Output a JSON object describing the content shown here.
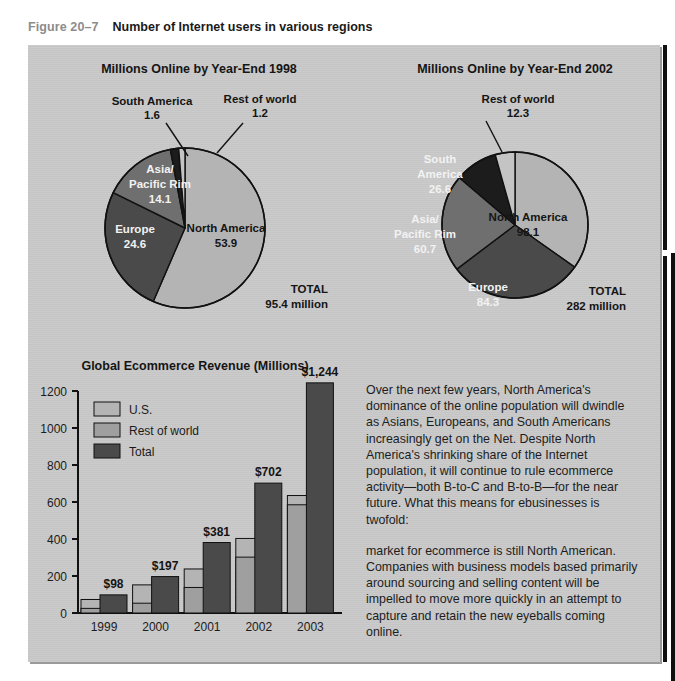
{
  "caption": {
    "figure_number": "Figure 20–7",
    "title": "Number of Internet users in various regions"
  },
  "colors": {
    "panel_bg": "#c9c9c9",
    "slice_light": "#b4b4b4",
    "slice_mid": "#9a9a9a",
    "slice_dark": "#4a4a4a",
    "slice_black": "#1c1c1c",
    "bar_us": "#b4b4b4",
    "bar_row": "#9f9f9f",
    "bar_total": "#4a4a4a",
    "outline": "#111111"
  },
  "chart_data": [
    {
      "type": "pie",
      "id": "pie-1998",
      "title": "Millions Online by Year-End 1998",
      "unit": "millions",
      "total_label": "TOTAL",
      "total_value": "95.4 million",
      "slices": [
        {
          "label": "North America",
          "value": 53.9,
          "value_label": "53.9",
          "color": "#b4b4b4",
          "label_placement": "inside",
          "label_color": "dark"
        },
        {
          "label": "Europe",
          "value": 24.6,
          "value_label": "24.6",
          "color": "#4a4a4a",
          "label_placement": "inside",
          "label_color": "light"
        },
        {
          "label": "Asia/\nPacific Rim",
          "value": 14.1,
          "value_label": "14.1",
          "color": "#6f6f6f",
          "label_placement": "inside",
          "label_color": "light"
        },
        {
          "label": "South America",
          "value": 1.6,
          "value_label": "1.6",
          "color": "#1c1c1c",
          "label_placement": "callout",
          "label_color": "dark"
        },
        {
          "label": "Rest of world",
          "value": 1.2,
          "value_label": "1.2",
          "color": "#c4c4c4",
          "label_placement": "callout",
          "label_color": "dark"
        }
      ]
    },
    {
      "type": "pie",
      "id": "pie-2002",
      "title": "Millions Online by Year-End 2002",
      "unit": "millions",
      "total_label": "TOTAL",
      "total_value": "282 million",
      "slices": [
        {
          "label": "North America",
          "value": 98.1,
          "value_label": "98.1",
          "color": "#b4b4b4",
          "label_placement": "inside",
          "label_color": "dark"
        },
        {
          "label": "Europe",
          "value": 84.3,
          "value_label": "84.3",
          "color": "#4a4a4a",
          "label_placement": "inside",
          "label_color": "light"
        },
        {
          "label": "Asia/\nPacific Rim",
          "value": 60.7,
          "value_label": "60.7",
          "color": "#6f6f6f",
          "label_placement": "inside",
          "label_color": "light"
        },
        {
          "label": "South America",
          "value": 26.6,
          "value_label": "26.6",
          "color": "#1c1c1c",
          "label_placement": "inside",
          "label_color": "light"
        },
        {
          "label": "Rest of world",
          "value": 12.3,
          "value_label": "12.3",
          "color": "#c4c4c4",
          "label_placement": "callout",
          "label_color": "dark"
        }
      ]
    },
    {
      "type": "bar",
      "id": "bar-ecommerce",
      "title": "Global Ecommerce Revenue (Millions)",
      "xlabel": "",
      "ylabel": "",
      "ylim": [
        0,
        1200
      ],
      "yticks": [
        0,
        200,
        400,
        600,
        800,
        1000,
        1200
      ],
      "ytick_labels": [
        "0",
        "200",
        "400",
        "600",
        "800",
        "1000",
        "1200"
      ],
      "grid": false,
      "legend_position": "top-left",
      "categories": [
        "1999",
        "2000",
        "2001",
        "2002",
        "2003"
      ],
      "series": [
        {
          "name": "U.S.",
          "color": "#b4b4b4",
          "values": [
            73,
            152,
            238,
            403,
            635
          ]
        },
        {
          "name": "Rest of world",
          "color": "#9f9f9f",
          "values": [
            25,
            53,
            138,
            302,
            585
          ]
        },
        {
          "name": "Total",
          "color": "#4a4a4a",
          "values": [
            98,
            197,
            381,
            702,
            1244
          ],
          "data_labels": [
            "$98",
            "$197",
            "$381",
            "$702",
            "$1,244"
          ]
        }
      ]
    }
  ],
  "body_copy": {
    "paragraph_1": "Over the next few years, North America's dominance of the online population will dwindle as Asians, Europeans, and South Americans increasingly get on the Net. Despite North America's shrinking share of the Internet population, it will continue to rule ecommerce activity—both B-to-C and B-to-B—for the near future. What this means for ebusinesses is twofold:",
    "paragraph_2": "market for ecommerce is still North American. Companies with business models based primarily around sourcing and selling content will be impelled to move more quickly in an attempt to capture and retain the new eyeballs coming online."
  }
}
